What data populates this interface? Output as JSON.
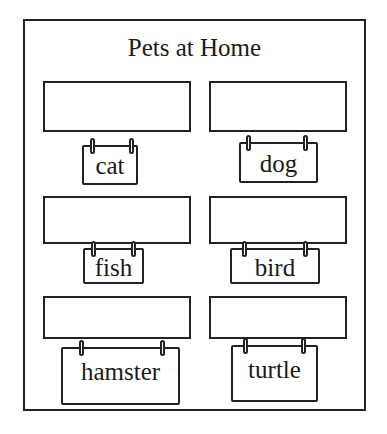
{
  "title": "Pets at Home",
  "cards": [
    {
      "label": "cat",
      "answer": ""
    },
    {
      "label": "dog",
      "answer": ""
    },
    {
      "label": "fish",
      "answer": ""
    },
    {
      "label": "bird",
      "answer": ""
    },
    {
      "label": "hamster",
      "answer": ""
    },
    {
      "label": "turtle",
      "answer": ""
    }
  ]
}
